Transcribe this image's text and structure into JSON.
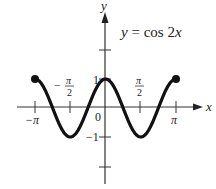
{
  "chart_data": {
    "type": "line",
    "title": "y = cos 2x",
    "function": "cos(2x)",
    "xlabel": "x",
    "ylabel": "y",
    "xlim": [
      -3.14159,
      3.14159
    ],
    "ylim": [
      -1,
      1
    ],
    "x_ticks": [
      {
        "value": -3.14159,
        "label": "−π"
      },
      {
        "value": -1.5708,
        "label": "−π/2"
      },
      {
        "value": 0,
        "label": "0"
      },
      {
        "value": 1.5708,
        "label": "π/2"
      },
      {
        "value": 3.14159,
        "label": "π"
      }
    ],
    "y_ticks": [
      {
        "value": 2,
        "label": ""
      },
      {
        "value": 1,
        "label": "1"
      },
      {
        "value": -1,
        "label": "−1"
      },
      {
        "value": -2,
        "label": ""
      }
    ],
    "endpoints": [
      [
        -3.14159,
        1
      ],
      [
        3.14159,
        1
      ]
    ],
    "series": [
      {
        "name": "y = cos 2x",
        "x": [
          -3.14159,
          -2.35619,
          -1.5708,
          -0.7854,
          0,
          0.7854,
          1.5708,
          2.35619,
          3.14159
        ],
        "values": [
          1,
          0,
          -1,
          0,
          1,
          0,
          -1,
          0,
          1
        ]
      }
    ],
    "grid": false,
    "legend": "none"
  },
  "labels": {
    "title_y": "y",
    "title_eq": " = cos 2",
    "title_x": "x",
    "axis_x": "x",
    "axis_y": "y",
    "tick_neg_pi": "−π",
    "tick_pi": "π",
    "tick_half_num": "π",
    "tick_half_den": "2",
    "tick_minus": "−",
    "origin": "0",
    "y_one": "1",
    "y_neg_one": "−1"
  }
}
